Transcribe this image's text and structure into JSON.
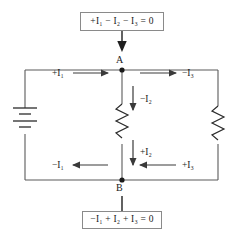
{
  "diagram": {
    "equations": {
      "top": "+I₁ − I₂ − I₃ = 0",
      "bottom": "−I₁ + I₂ + I₃ = 0"
    },
    "nodes": [
      {
        "id": "A",
        "label": "A"
      },
      {
        "id": "B",
        "label": "B"
      }
    ],
    "current_labels": {
      "i1_top": "+I₁",
      "i3_top": "−I₃",
      "i2_upper": "−I₂",
      "i2_lower": "+I₂",
      "i1_bottom": "−I₁",
      "i3_bottom": "+I₃"
    },
    "components": {
      "battery": "battery-symbol",
      "resistor_middle": "resistor-symbol",
      "resistor_right": "resistor-symbol"
    },
    "colors": {
      "wire": "#5a5a5a",
      "ink": "#1a1a1a",
      "box_border": "#8a8a8a",
      "background": "#ffffff"
    }
  }
}
